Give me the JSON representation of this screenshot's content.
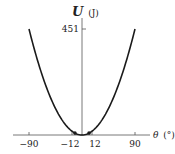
{
  "chart_data": {
    "type": "line",
    "title": "",
    "xlabel": "θ (°)",
    "ylabel": "U (J)",
    "ylabel_symbol": "U",
    "ylabel_unit": "(J)",
    "xlabel_symbol": "θ",
    "xlabel_unit": "(°)",
    "x_ticks": [
      -90,
      -12,
      12,
      90
    ],
    "x_tick_labels": [
      "−90",
      "−12",
      "12",
      "90"
    ],
    "y_ticks": [
      451
    ],
    "y_tick_labels": [
      "451"
    ],
    "xlim": [
      -100,
      100
    ],
    "ylim": [
      0,
      480
    ],
    "grid": false,
    "series": [
      {
        "name": "U(θ)",
        "shape": "parabola",
        "x": [
          -90,
          -60,
          -30,
          -12,
          0,
          12,
          30,
          60,
          90
        ],
        "values": [
          451,
          200,
          50,
          8,
          0,
          8,
          50,
          200,
          451
        ]
      }
    ],
    "markers": [
      {
        "x": -12,
        "y": 8
      },
      {
        "x": 12,
        "y": 8
      }
    ]
  },
  "colors": {
    "curve": "#1a1a1a",
    "axis": "#555555",
    "text": "#222222"
  }
}
